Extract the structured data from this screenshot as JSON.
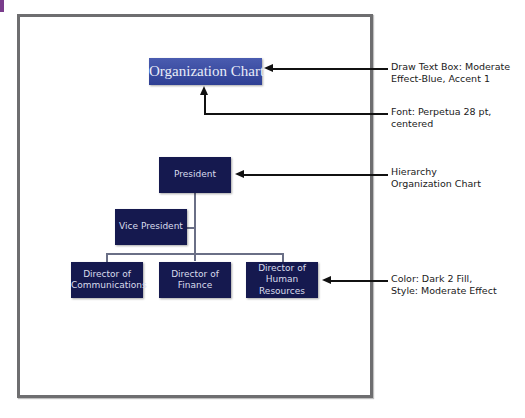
{
  "diagram": {
    "title_box": {
      "text": "Organization Chart",
      "fill": "#3a4ca3"
    },
    "nodes": {
      "president": "President",
      "vice_president": "Vice President",
      "dir_communications": "Director of Communications",
      "dir_finance": "Director of Finance",
      "dir_hr": "Director of Human Resources"
    },
    "node_fill": "#15194f"
  },
  "callouts": [
    {
      "line1": "Draw Text Box:  Moderate",
      "line2": "Effect-Blue, Accent 1"
    },
    {
      "line1": "Font: Perpetua 28 pt,",
      "line2": "centered"
    },
    {
      "line1": "Hierarchy",
      "line2": "Organization Chart"
    },
    {
      "line1": "Color: Dark 2 Fill,",
      "line2": "Style: Moderate Effect"
    }
  ]
}
